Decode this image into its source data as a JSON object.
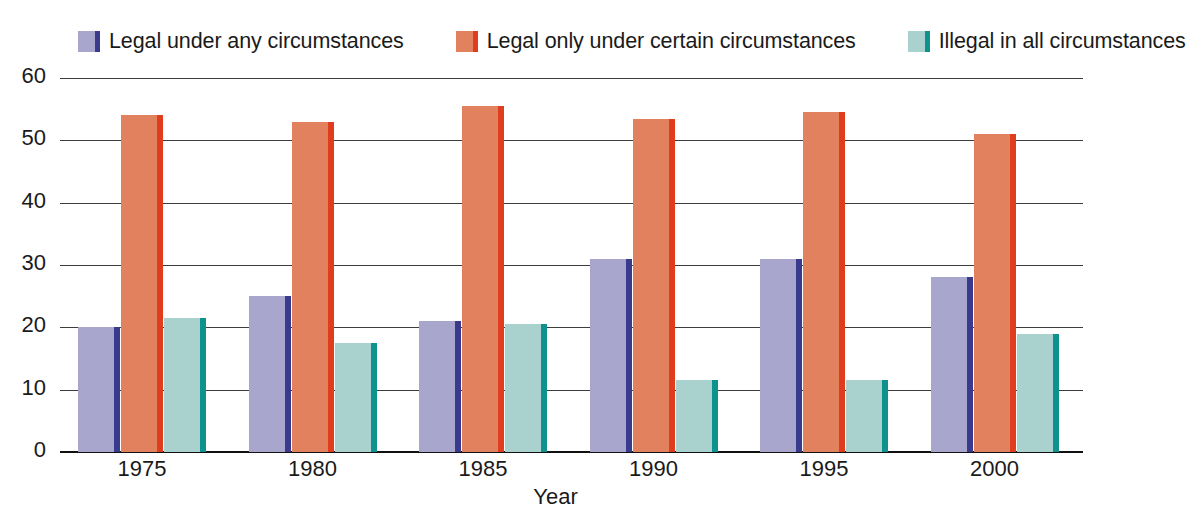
{
  "chart_data": {
    "type": "bar",
    "title": "",
    "xlabel": "Year",
    "ylabel": "",
    "categories": [
      "1975",
      "1980",
      "1985",
      "1990",
      "1995",
      "2000"
    ],
    "ylim": [
      0,
      60
    ],
    "yticks": [
      "0",
      "10",
      "20",
      "30",
      "40",
      "50",
      "60"
    ],
    "ytick_values": [
      0,
      10,
      20,
      30,
      40,
      50,
      60
    ],
    "grid": true,
    "legend_position": "top",
    "series": [
      {
        "name": "Legal under any circumstances",
        "face_color": "#a9a6cd",
        "edge_color": "#3a3a8c",
        "values": [
          20,
          25,
          21,
          31,
          31,
          28
        ]
      },
      {
        "name": "Legal only under certain circumstances",
        "face_color": "#e2815e",
        "edge_color": "#e03c1e",
        "values": [
          54,
          53,
          55.5,
          53.5,
          54.5,
          51
        ]
      },
      {
        "name": "Illegal in all circumstances",
        "face_color": "#a9d2ce",
        "edge_color": "#0f918d",
        "values": [
          21.5,
          17.5,
          20.5,
          11.5,
          11.5,
          19
        ]
      }
    ]
  },
  "axis_color": "#3d3d3d",
  "baseline_color": "#111111"
}
